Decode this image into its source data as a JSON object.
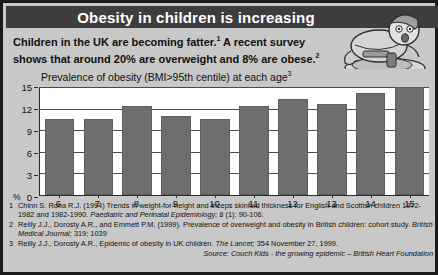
{
  "header": {
    "title": "Obesity in children is increasing"
  },
  "intro": {
    "line1_a": "Children in the UK are becoming fatter.",
    "line1_sup": "1",
    "line1_b": " A recent survey",
    "line2_a": "shows that around 20% are overweight and 8% are obese.",
    "line2_sup": "2"
  },
  "illustration": {
    "name": "overweight-child-cartoon"
  },
  "chart_data": {
    "type": "bar",
    "title": "Prevalence of obesity (BMI>95th centile) at each age",
    "title_sup": "3",
    "xlabel": "",
    "ylabel": "%",
    "categories": [
      "6",
      "7",
      "8",
      "9",
      "10",
      "11",
      "12",
      "13",
      "14",
      "15"
    ],
    "values": [
      10.5,
      10.5,
      12.3,
      11.0,
      10.6,
      12.3,
      13.4,
      12.6,
      14.2,
      15.0
    ],
    "ylim": [
      0,
      15
    ],
    "yticks": [
      0,
      3,
      6,
      9,
      12,
      15
    ],
    "ytick_labels": [
      "0",
      "3",
      "6",
      "9",
      "12",
      "15"
    ],
    "grid": true,
    "legend": false,
    "bar_color": "#6e6e6e",
    "plot_background": "#ffffff"
  },
  "references": [
    {
      "num": "1",
      "text_a": "Chinn S. Rona R.J. (1994) Trends in weight-for-height and triceps skinfold thickness for English and Scottish children 1972-1982 and 1982-1990. ",
      "italic": "Paediatric and Perinatal Epidemiology;",
      "text_b": " 8 (1): 90-106."
    },
    {
      "num": "2",
      "text_a": "Reilly J.J., Dorosty A.R., and Emmett P.M. (1999). Prevalence of overweight and obesity in British children: cohort study. ",
      "italic": "British Medical Journal;",
      "text_b": " 319; 1039"
    },
    {
      "num": "3",
      "text_a": "Reilly J.J., Dorosty A.R.,  Epidemic of obesity in UK children. ",
      "italic": "The Lancet;",
      "text_b": " 354 November 27, 1999."
    }
  ],
  "source": "Source: Couch Kids - the growing epidemic – British Heart Foundation",
  "colors": {
    "banner_background": "#3d3d3d",
    "banner_text": "#ffffff",
    "poster_background": "#c8c8c8",
    "bar": "#6e6e6e",
    "border": "#1a1a1a"
  }
}
